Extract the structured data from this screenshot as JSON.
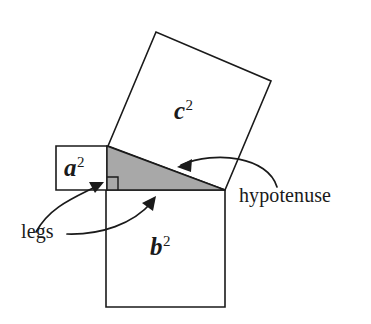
{
  "figure": {
    "labels": {
      "a_square": "a",
      "a_square_exponent": "2",
      "b_square": "b",
      "b_square_exponent": "2",
      "c_square": "c",
      "c_square_exponent": "2",
      "hypotenuse": "hypotenuse",
      "legs": "legs"
    },
    "colors": {
      "stroke": "#1a1a1a",
      "triangle_fill": "#a8a8a8",
      "square_fill": "#ffffff",
      "background": "#ffffff"
    },
    "geometry": {
      "triangle_vertices": "107,146 107,190 225,190",
      "square_a_points": "56,146 107,146 107,190 56,190",
      "square_b_points": "106,190 225,190 225,307 106,307",
      "square_c_points": "108,146 156,32 271,81 225,190",
      "right_angle_marker": "107,178 117,178 117,190",
      "arrow_hypotenuse_path": "M 276,186 C 262,160 215,152 180,164",
      "arrow_hypotenuse_head": "180,164 193,160 191,172",
      "arrow_legs_upper_path": "M 40,235 C 52,208 78,196 100,184",
      "arrow_legs_upper_head": "100,184 87,184 93,194",
      "arrow_legs_lower_path": "M 66,234 C 100,234 134,222 154,199",
      "arrow_legs_lower_head": "154,199 142,205 152,211"
    }
  }
}
